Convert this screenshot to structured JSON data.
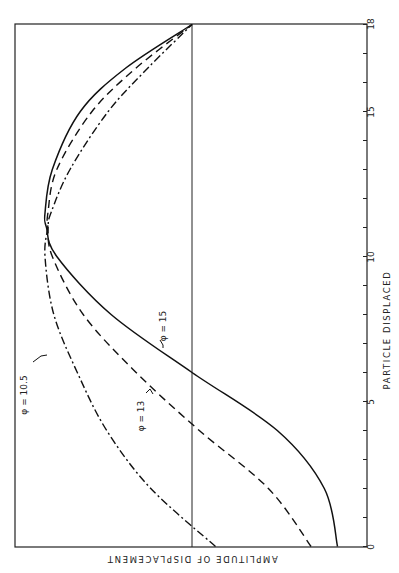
{
  "chart_data": {
    "type": "line",
    "orientation_note": "figure rotated 90 degrees clockwise",
    "title": "",
    "xlabel": "PARTICLE DISPLACED",
    "ylabel": "AMPLITUDE OF DISPLACEMENT",
    "xlim": [
      0,
      18
    ],
    "ylim": [
      -1.2,
      1.0
    ],
    "xticks": [
      0,
      1,
      2,
      3,
      4,
      5,
      6,
      7,
      8,
      9,
      10,
      11,
      12,
      13,
      14,
      15,
      16,
      17,
      18
    ],
    "xtick_labels": [
      {
        "value": 0,
        "label": "0"
      },
      {
        "value": 5,
        "label": "5"
      },
      {
        "value": 10,
        "label": "10"
      },
      {
        "value": 15,
        "label": "15"
      },
      {
        "value": 18,
        "label": "18"
      }
    ],
    "zero_line": true,
    "grid": false,
    "x": [
      0,
      2,
      4,
      6,
      8,
      10,
      11,
      11.5,
      13,
      15,
      16.5,
      18
    ],
    "series": [
      {
        "name": "φ = 15",
        "style": "solid",
        "values": [
          -0.99,
          -0.9,
          -0.58,
          0.0,
          0.55,
          0.92,
          0.99,
          1.0,
          0.95,
          0.76,
          0.45,
          0.0
        ]
      },
      {
        "name": "φ = 13",
        "style": "dashed",
        "values": [
          -0.81,
          -0.52,
          -0.05,
          0.38,
          0.74,
          0.95,
          0.98,
          0.98,
          0.92,
          0.68,
          0.38,
          0.0
        ]
      },
      {
        "name": "φ = 10.5",
        "style": "dashdot",
        "values": [
          -0.16,
          0.28,
          0.58,
          0.78,
          0.94,
          1.0,
          0.98,
          0.96,
          0.83,
          0.57,
          0.3,
          0.0
        ]
      }
    ],
    "annotations": [
      {
        "text": "φ = 10.5",
        "target_series": "φ = 10.5"
      },
      {
        "text": "φ = 13",
        "target_series": "φ = 13"
      },
      {
        "text": "φ = 15",
        "target_series": "φ = 15"
      }
    ]
  },
  "labels": {
    "xlabel": "PARTICLE DISPLACED",
    "ylabel": "AMPLITUDE OF DISPLACEMENT",
    "phi_105": "φ = 10.5",
    "phi_13": "φ = 13",
    "phi_15": "φ = 15",
    "tick_0": "0",
    "tick_5": "5",
    "tick_10": "10",
    "tick_15": "15",
    "tick_18": "18"
  }
}
